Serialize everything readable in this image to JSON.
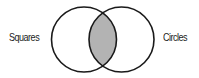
{
  "diagram": {
    "type": "venn",
    "sets": [
      {
        "label": "Squares"
      },
      {
        "label": "Circles"
      }
    ],
    "highlighted_region": "intersection",
    "colors": {
      "outline": "#1a1a1a",
      "intersection_fill": "#b3b3b3",
      "background": "#ffffff"
    }
  }
}
